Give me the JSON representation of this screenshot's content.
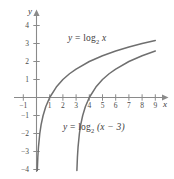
{
  "figure": {
    "background_color": "#ffffff",
    "axis_color": "#8a8a8a",
    "curve_color": "#6f6f6f",
    "text_color": "#3d3d3d"
  },
  "axes": {
    "x_name": "x",
    "y_name": "y",
    "x_ticks": [
      {
        "value": -1,
        "label": "−1"
      },
      {
        "value": 1,
        "label": "1"
      },
      {
        "value": 2,
        "label": "2"
      },
      {
        "value": 3,
        "label": "3"
      },
      {
        "value": 4,
        "label": "4"
      },
      {
        "value": 5,
        "label": "5"
      },
      {
        "value": 6,
        "label": "6"
      },
      {
        "value": 7,
        "label": "7"
      },
      {
        "value": 8,
        "label": "8"
      },
      {
        "value": 9,
        "label": "9"
      }
    ],
    "y_ticks": [
      {
        "value": 4,
        "label": "4"
      },
      {
        "value": 3,
        "label": "3"
      },
      {
        "value": 2,
        "label": "2"
      },
      {
        "value": 1,
        "label": "1"
      },
      {
        "value": -1,
        "label": "−1"
      },
      {
        "value": -2,
        "label": "−2"
      },
      {
        "value": -3,
        "label": "−3"
      },
      {
        "value": -4,
        "label": "−4"
      }
    ]
  },
  "labels": {
    "curve1": {
      "lhs": "y",
      "eq": "=",
      "fn": "log",
      "base": "2",
      "arg": "x"
    },
    "curve2": {
      "lhs": "y",
      "eq": "=",
      "fn": "log",
      "base": "2",
      "arg": "(x − 3)"
    }
  },
  "chart_data": {
    "type": "line",
    "title": "",
    "xlabel": "x",
    "ylabel": "y",
    "xlim": [
      -1.6,
      10.2
    ],
    "ylim": [
      -4.6,
      4.6
    ],
    "grid": false,
    "legend": "inline-annotations",
    "series": [
      {
        "name": "y = log_2 x",
        "equation": "y = log2(x)",
        "asymptote_x": 0,
        "x_intercept": 1,
        "x": [
          0.06,
          0.1,
          0.15,
          0.25,
          0.35,
          0.5,
          0.7,
          1,
          1.5,
          2,
          2.5,
          3,
          4,
          5,
          6,
          7,
          8,
          9
        ],
        "y": [
          -4.06,
          -3.32,
          -2.74,
          -2.0,
          -1.51,
          -1.0,
          -0.51,
          0,
          0.58,
          1.0,
          1.32,
          1.58,
          2.0,
          2.32,
          2.58,
          2.81,
          3.0,
          3.17
        ]
      },
      {
        "name": "y = log_2 (x - 3)",
        "equation": "y = log2(x-3)",
        "asymptote_x": 3,
        "x_intercept": 4,
        "x": [
          3.06,
          3.1,
          3.15,
          3.25,
          3.35,
          3.5,
          3.7,
          4,
          4.5,
          5,
          5.5,
          6,
          7,
          8,
          9
        ],
        "y": [
          -4.06,
          -3.32,
          -2.74,
          -2.0,
          -1.51,
          -1.0,
          -0.51,
          0,
          0.58,
          1.0,
          1.32,
          1.58,
          2.0,
          2.32,
          2.58
        ]
      }
    ]
  }
}
